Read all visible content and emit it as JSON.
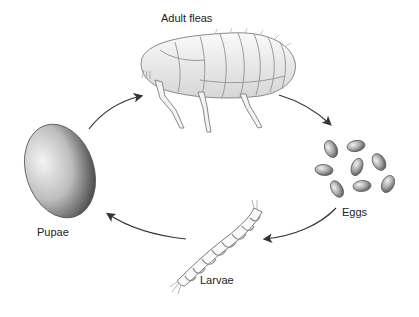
{
  "diagram": {
    "stages": [
      {
        "id": "adult",
        "label": "Adult fleas"
      },
      {
        "id": "eggs",
        "label": "Eggs"
      },
      {
        "id": "larvae",
        "label": "Larvae"
      },
      {
        "id": "pupae",
        "label": "Pupae"
      }
    ],
    "arrows": [
      {
        "from": "pupae",
        "to": "adult"
      },
      {
        "from": "adult",
        "to": "eggs"
      },
      {
        "from": "eggs",
        "to": "larvae"
      },
      {
        "from": "larvae",
        "to": "pupae"
      }
    ],
    "colors": {
      "background": "#ffffff",
      "text": "#222222",
      "arrow": "#333333",
      "illustration": "#9a9a9a"
    }
  }
}
